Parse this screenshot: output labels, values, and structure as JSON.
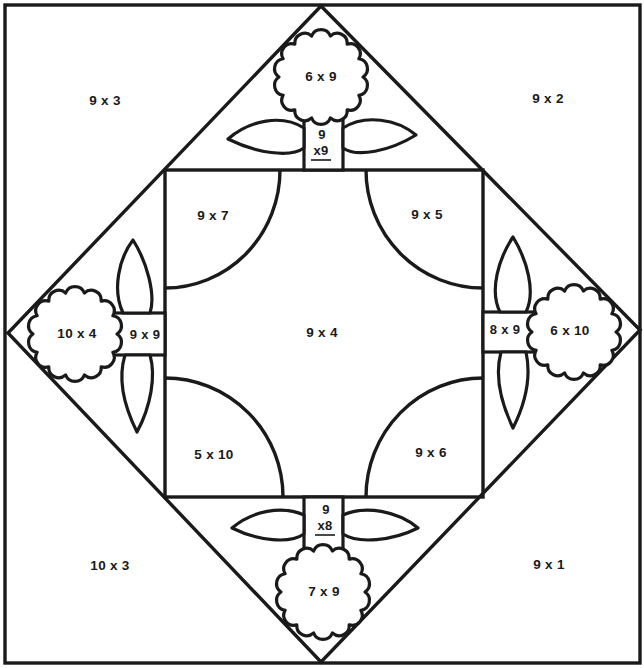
{
  "worksheet": {
    "outer_corners": {
      "top_left": "9 x 3",
      "top_right": "9 x 2",
      "bottom_left": "10 x 3",
      "bottom_right": "9 x 1"
    },
    "center": "9 x 4",
    "quarter_circles": {
      "top_left": "9 x 7",
      "top_right": "9 x 5",
      "bottom_left": "5 x 10",
      "bottom_right": "9 x 6"
    },
    "flowers": {
      "top": {
        "bloom": "6 x 9",
        "stem_top": "9",
        "stem_bottom": "x9"
      },
      "left": {
        "bloom": "10 x 4",
        "stem": "9 x 9"
      },
      "right": {
        "bloom": "6 x 10",
        "stem": "8 x 9"
      },
      "bottom": {
        "bloom": "7 x 9",
        "stem_top": "9",
        "stem_bottom": "x8"
      }
    },
    "colors": {
      "line": "#1a1a1a",
      "background": "#ffffff"
    }
  }
}
